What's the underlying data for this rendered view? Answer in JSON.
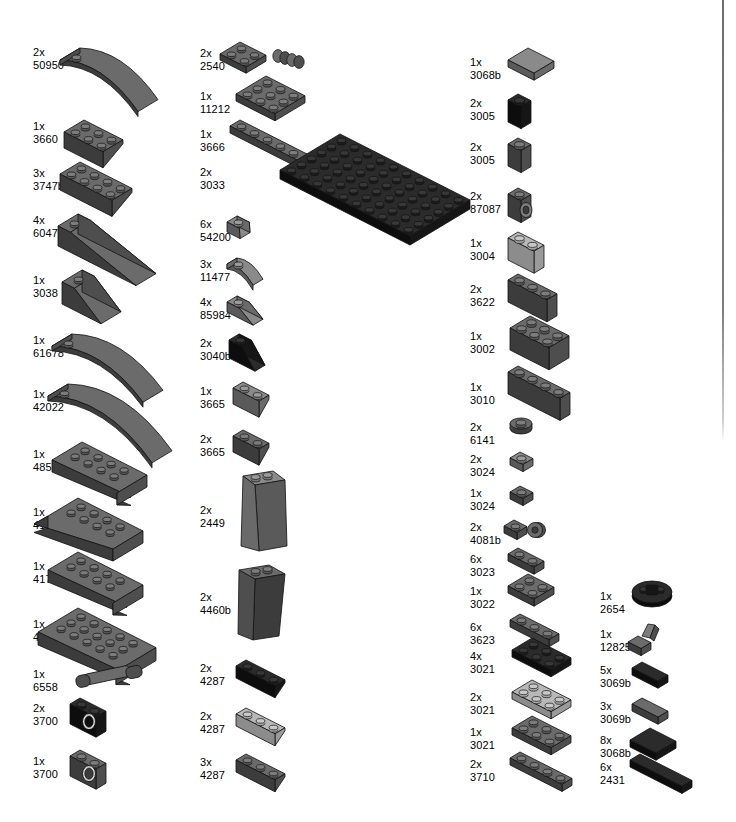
{
  "page": {
    "kind": "lego-parts-inventory",
    "width": 736,
    "height": 822,
    "background": "#ffffff",
    "rule_color": "#757575"
  },
  "palette": {
    "black_top": "#2b2b2b",
    "black_side": "#161616",
    "black_front": "#0d0d0d",
    "dark_gray_top": "#6b6b6b",
    "dark_gray_side": "#4e4e4e",
    "dark_gray_front": "#3c3c3c",
    "mid_gray_top": "#8a8a8a",
    "mid_gray_side": "#6a6a6a",
    "mid_gray_front": "#5a5a5a",
    "light_gray_top": "#b8b8b8",
    "light_gray_side": "#9a9a9a",
    "light_gray_front": "#8c8c8c",
    "outline": "#111111"
  },
  "columns": [
    {
      "name": "column-1",
      "label_x": 33,
      "parts": [
        {
          "qty": "2x",
          "id": "50950",
          "label_y": 46,
          "color": "dark",
          "shape": "curved-slope-3x1",
          "px": 72,
          "py": 34,
          "w": 116,
          "h": 58
        },
        {
          "qty": "1x",
          "id": "3660",
          "label_y": 120,
          "color": "dark",
          "shape": "inverted-slope-2x2",
          "px": 72,
          "py": 108,
          "w": 116,
          "h": 48
        },
        {
          "qty": "3x",
          "id": "3747b",
          "label_y": 167,
          "color": "dark",
          "shape": "inverted-slope-3x2",
          "px": 66,
          "py": 152,
          "w": 124,
          "h": 52
        },
        {
          "qty": "4x",
          "id": "60477",
          "label_y": 214,
          "color": "dark",
          "shape": "slope-long-6x1",
          "px": 70,
          "py": 204,
          "w": 122,
          "h": 52
        },
        {
          "qty": "1x",
          "id": "3038",
          "label_y": 274,
          "color": "dark",
          "shape": "slope-3x2",
          "px": 72,
          "py": 258,
          "w": 116,
          "h": 56
        },
        {
          "qty": "1x",
          "id": "61678",
          "label_y": 334,
          "color": "dark",
          "shape": "curved-slope-4x1",
          "px": 66,
          "py": 320,
          "w": 126,
          "h": 50
        },
        {
          "qty": "1x",
          "id": "42022",
          "label_y": 388,
          "color": "dark",
          "shape": "curved-slope-6x1",
          "px": 62,
          "py": 372,
          "w": 136,
          "h": 60
        },
        {
          "qty": "1x",
          "id": "4855",
          "label_y": 448,
          "color": "dark",
          "shape": "wedge-inverted-6x4",
          "px": 56,
          "py": 428,
          "w": 152,
          "h": 62
        },
        {
          "qty": "1x",
          "id": "41764",
          "label_y": 506,
          "color": "dark",
          "shape": "wedge-curved-left",
          "px": 54,
          "py": 486,
          "w": 156,
          "h": 62
        },
        {
          "qty": "1x",
          "id": "41765",
          "label_y": 560,
          "color": "dark",
          "shape": "wedge-curved-right",
          "px": 54,
          "py": 540,
          "w": 158,
          "h": 62
        },
        {
          "qty": "1x",
          "id": "43713",
          "label_y": 618,
          "color": "dark",
          "shape": "wedge-curved-big",
          "px": 52,
          "py": 592,
          "w": 160,
          "h": 74
        },
        {
          "qty": "1x",
          "id": "6558",
          "label_y": 668,
          "color": "dark",
          "shape": "technic-pin-long",
          "px": 72,
          "py": 662,
          "w": 80,
          "h": 26
        },
        {
          "qty": "2x",
          "id": "3700",
          "label_y": 702,
          "color": "black",
          "shape": "technic-brick-1x2",
          "px": 74,
          "py": 692,
          "w": 62,
          "h": 44
        },
        {
          "qty": "1x",
          "id": "3700",
          "label_y": 755,
          "color": "dark",
          "shape": "technic-brick-1x2",
          "px": 74,
          "py": 744,
          "w": 62,
          "h": 44
        }
      ]
    },
    {
      "name": "column-2",
      "label_x": 200,
      "parts": [
        {
          "qty": "2x",
          "id": "2540",
          "label_y": 47,
          "color": "dark",
          "shape": "plate-handle-1x2",
          "px": 232,
          "py": 36,
          "w": 88,
          "h": 34
        },
        {
          "qty": "1x",
          "id": "11212",
          "label_y": 90,
          "color": "dark",
          "shape": "plate-3x3",
          "px": 236,
          "py": 72,
          "w": 84,
          "h": 48
        },
        {
          "qty": "1x",
          "id": "3666",
          "label_y": 128,
          "color": "dark",
          "shape": "plate-1x6",
          "px": 236,
          "py": 118,
          "w": 102,
          "h": 30
        },
        {
          "qty": "2x",
          "id": "3033",
          "label_y": 166,
          "color": "black",
          "shape": "baseplate-6x10",
          "px": 240,
          "py": 130,
          "w": 212,
          "h": 110
        },
        {
          "qty": "6x",
          "id": "54200",
          "label_y": 218,
          "color": "mid",
          "shape": "slope-1x1-33",
          "px": 233,
          "py": 208,
          "w": 40,
          "h": 30
        },
        {
          "qty": "3x",
          "id": "11477",
          "label_y": 258,
          "color": "mid",
          "shape": "curved-slope-2x1",
          "px": 233,
          "py": 250,
          "w": 44,
          "h": 32
        },
        {
          "qty": "4x",
          "id": "85984",
          "label_y": 296,
          "color": "mid",
          "shape": "slope-2x1-30",
          "px": 233,
          "py": 288,
          "w": 46,
          "h": 30
        },
        {
          "qty": "2x",
          "id": "3040b",
          "label_y": 337,
          "color": "black",
          "shape": "slope-2x1-45",
          "px": 233,
          "py": 326,
          "w": 50,
          "h": 40
        },
        {
          "qty": "1x",
          "id": "3665",
          "label_y": 385,
          "color": "mid",
          "shape": "inverted-slope-2x1",
          "px": 233,
          "py": 372,
          "w": 56,
          "h": 40
        },
        {
          "qty": "2x",
          "id": "3665",
          "label_y": 433,
          "color": "dark",
          "shape": "inverted-slope-2x1",
          "px": 233,
          "py": 420,
          "w": 56,
          "h": 40
        },
        {
          "qty": "2x",
          "id": "2449",
          "label_y": 504,
          "color": "mid",
          "shape": "slope-inverted-tall-3x1",
          "px": 233,
          "py": 464,
          "w": 48,
          "h": 90
        },
        {
          "qty": "2x",
          "id": "4460b",
          "label_y": 591,
          "color": "dark",
          "shape": "slope-tall-3x1",
          "px": 233,
          "py": 558,
          "w": 48,
          "h": 86
        },
        {
          "qty": "2x",
          "id": "4287",
          "label_y": 662,
          "color": "black",
          "shape": "inverted-slope-3x1",
          "px": 236,
          "py": 652,
          "w": 70,
          "h": 32
        },
        {
          "qty": "2x",
          "id": "4287",
          "label_y": 710,
          "color": "light",
          "shape": "inverted-slope-3x1",
          "px": 236,
          "py": 700,
          "w": 70,
          "h": 32
        },
        {
          "qty": "3x",
          "id": "4287",
          "label_y": 756,
          "color": "dark",
          "shape": "inverted-slope-3x1",
          "px": 236,
          "py": 746,
          "w": 70,
          "h": 32
        }
      ]
    },
    {
      "name": "column-3",
      "label_x": 470,
      "parts": [
        {
          "qty": "1x",
          "id": "3068b",
          "label_y": 56,
          "color": "mid",
          "shape": "tile-2x2",
          "px": 506,
          "py": 44,
          "w": 58,
          "h": 34
        },
        {
          "qty": "2x",
          "id": "3005",
          "label_y": 97,
          "color": "black",
          "shape": "brick-1x1",
          "px": 506,
          "py": 88,
          "w": 36,
          "h": 38
        },
        {
          "qty": "2x",
          "id": "3005",
          "label_y": 141,
          "color": "dark",
          "shape": "brick-1x1",
          "px": 506,
          "py": 132,
          "w": 36,
          "h": 38
        },
        {
          "qty": "2x",
          "id": "87087",
          "label_y": 190,
          "color": "dark",
          "shape": "brick-1x1-stud-side",
          "px": 506,
          "py": 180,
          "w": 38,
          "h": 40
        },
        {
          "qty": "1x",
          "id": "3004",
          "label_y": 237,
          "color": "light",
          "shape": "brick-1x2",
          "px": 506,
          "py": 226,
          "w": 52,
          "h": 40
        },
        {
          "qty": "2x",
          "id": "3622",
          "label_y": 283,
          "color": "dark",
          "shape": "brick-1x3",
          "px": 506,
          "py": 270,
          "w": 68,
          "h": 42
        },
        {
          "qty": "1x",
          "id": "3002",
          "label_y": 330,
          "color": "dark",
          "shape": "brick-2x3",
          "px": 506,
          "py": 312,
          "w": 76,
          "h": 52
        },
        {
          "qty": "1x",
          "id": "3010",
          "label_y": 381,
          "color": "dark",
          "shape": "brick-1x4",
          "px": 506,
          "py": 362,
          "w": 84,
          "h": 46
        },
        {
          "qty": "2x",
          "id": "6141",
          "label_y": 421,
          "color": "dark",
          "shape": "round-plate-1x1",
          "px": 508,
          "py": 416,
          "w": 26,
          "h": 20
        },
        {
          "qty": "2x",
          "id": "3024",
          "label_y": 453,
          "color": "mid",
          "shape": "plate-1x1",
          "px": 508,
          "py": 448,
          "w": 26,
          "h": 20
        },
        {
          "qty": "1x",
          "id": "3024",
          "label_y": 487,
          "color": "dark",
          "shape": "plate-1x1",
          "px": 508,
          "py": 482,
          "w": 26,
          "h": 20
        },
        {
          "qty": "2x",
          "id": "4081b",
          "label_y": 521,
          "color": "dark",
          "shape": "plate-1x1-clip",
          "px": 506,
          "py": 514,
          "w": 42,
          "h": 24
        },
        {
          "qty": "6x",
          "id": "3023",
          "label_y": 553,
          "color": "dark",
          "shape": "plate-1x2",
          "px": 506,
          "py": 546,
          "w": 46,
          "h": 22
        },
        {
          "qty": "1x",
          "id": "3022",
          "label_y": 585,
          "color": "dark",
          "shape": "plate-2x2",
          "px": 506,
          "py": 572,
          "w": 54,
          "h": 32
        },
        {
          "qty": "6x",
          "id": "3623",
          "label_y": 621,
          "color": "dark",
          "shape": "plate-1x3",
          "px": 506,
          "py": 612,
          "w": 60,
          "h": 24
        },
        {
          "qty": "4x",
          "id": "3021",
          "label_y": 650,
          "color": "black",
          "shape": "plate-2x3",
          "px": 506,
          "py": 636,
          "w": 72,
          "h": 34
        },
        {
          "qty": "2x",
          "id": "3021",
          "label_y": 691,
          "color": "light",
          "shape": "plate-2x3",
          "px": 506,
          "py": 678,
          "w": 72,
          "h": 34
        },
        {
          "qty": "1x",
          "id": "3021",
          "label_y": 726,
          "color": "dark",
          "shape": "plate-2x3",
          "px": 506,
          "py": 714,
          "w": 72,
          "h": 34
        },
        {
          "qty": "2x",
          "id": "3710",
          "label_y": 758,
          "color": "dark",
          "shape": "plate-1x4",
          "px": 506,
          "py": 750,
          "w": 70,
          "h": 26
        }
      ]
    },
    {
      "name": "column-4",
      "label_x": 600,
      "parts": [
        {
          "qty": "1x",
          "id": "2654",
          "label_y": 590,
          "color": "black",
          "shape": "round-plate-2x2-boat",
          "px": 632,
          "py": 582,
          "w": 42,
          "h": 26
        },
        {
          "qty": "1x",
          "id": "12825",
          "label_y": 628,
          "color": "dark",
          "shape": "tile-1x1-clip",
          "px": 632,
          "py": 622,
          "w": 32,
          "h": 26
        },
        {
          "qty": "5x",
          "id": "3069b",
          "label_y": 664,
          "color": "black",
          "shape": "tile-1x2",
          "px": 630,
          "py": 658,
          "w": 48,
          "h": 22
        },
        {
          "qty": "3x",
          "id": "3069b",
          "label_y": 700,
          "color": "dark",
          "shape": "tile-1x2",
          "px": 630,
          "py": 694,
          "w": 48,
          "h": 22
        },
        {
          "qty": "8x",
          "id": "3068b",
          "label_y": 734,
          "color": "black",
          "shape": "tile-2x2",
          "px": 628,
          "py": 724,
          "w": 56,
          "h": 30
        },
        {
          "qty": "6x",
          "id": "2431",
          "label_y": 761,
          "color": "black",
          "shape": "tile-1x4",
          "px": 628,
          "py": 752,
          "w": 72,
          "h": 26
        }
      ]
    }
  ]
}
